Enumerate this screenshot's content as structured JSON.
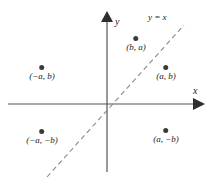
{
  "figure": {
    "type": "coordinate-plane-diagram",
    "background_color": "#ffffff",
    "axis_color": "#555555",
    "dashed_line_color": "#8a8a8a",
    "point_color": "#3a3a3a",
    "text_color": "#1a1a1a"
  },
  "axes": {
    "x_axis_label": "x",
    "y_axis_label": "y",
    "origin": {
      "x": 107,
      "y": 104
    },
    "x_axis": {
      "x1": 8,
      "y1": 104,
      "x2": 197,
      "y2": 104
    },
    "y_axis": {
      "x1": 107,
      "y1": 20,
      "x2": 107,
      "y2": 172
    }
  },
  "reference_line": {
    "label": "y = x",
    "style": "dashed",
    "x1": 47,
    "y1": 177,
    "x2": 184,
    "y2": 25
  },
  "points": [
    {
      "label": "(b, a)",
      "dot_x": 136,
      "dot_y": 39,
      "label_x": 136,
      "label_y": 44
    },
    {
      "label": "(−a, b)",
      "dot_x": 42,
      "dot_y": 68,
      "label_x": 42,
      "label_y": 73
    },
    {
      "label": "(a, b)",
      "dot_x": 166,
      "dot_y": 68,
      "label_x": 166,
      "label_y": 73
    },
    {
      "label": "(−a, −b)",
      "dot_x": 42,
      "dot_y": 132,
      "label_x": 42,
      "label_y": 137
    },
    {
      "label": "(a, −b)",
      "dot_x": 166,
      "dot_y": 131,
      "label_x": 166,
      "label_y": 136
    }
  ],
  "labels": {
    "y_axis_name_pos": {
      "x": 115,
      "y": 17
    },
    "x_axis_name_pos": {
      "x": 193,
      "y": 88
    },
    "line_label_pos": {
      "x": 148,
      "y": 12
    }
  }
}
